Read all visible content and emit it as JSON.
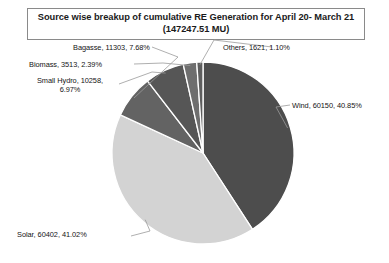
{
  "title": {
    "line1": "Source wise breakup of cumulative RE Generation for April 20- March 21",
    "line2": "(147247.51 MU)"
  },
  "labels": {
    "bagasse": "Bagasse, 11303, 7.68%",
    "others": "Others, 1621, 1.10%",
    "biomass": "Biomass, 3513, 2.39%",
    "small_hydro": "Small Hydro, 10258, 6.97%",
    "wind": "Wind, 60150, 40.85%",
    "solar": "Solar, 60402, 41.02%"
  },
  "chart_data": {
    "type": "pie",
    "title": "Source wise breakup of cumulative RE Generation for April 20- March 21 (147247.51 MU)",
    "unit": "MU",
    "total": 147247.51,
    "legend": "none",
    "labels_position": "outside-with-leader-lines",
    "start_angle_deg": 0,
    "direction": "clockwise",
    "categories": [
      "Wind",
      "Solar",
      "Bagasse",
      "Small Hydro",
      "Biomass",
      "Others"
    ],
    "values": [
      60150,
      60402,
      11303,
      10258,
      3513,
      1621
    ],
    "percents": [
      40.85,
      41.02,
      7.68,
      6.97,
      2.39,
      1.1
    ],
    "colors": [
      "#4d4d4d",
      "#d3d3d3",
      "#636363",
      "#565656",
      "#6e6e6e",
      "#5e5e5e"
    ],
    "slices": [
      {
        "name": "Wind",
        "value": 60150,
        "percent": 40.85,
        "color": "#4d4d4d",
        "label": "Wind, 60150, 40.85%"
      },
      {
        "name": "Solar",
        "value": 60402,
        "percent": 41.02,
        "color": "#d3d3d3",
        "label": "Solar, 60402, 41.02%"
      },
      {
        "name": "Bagasse",
        "value": 11303,
        "percent": 7.68,
        "color": "#636363",
        "label": "Bagasse, 11303, 7.68%"
      },
      {
        "name": "Small Hydro",
        "value": 10258,
        "percent": 6.97,
        "color": "#565656",
        "label": "Small Hydro, 10258, 6.97%"
      },
      {
        "name": "Biomass",
        "value": 3513,
        "percent": 2.39,
        "color": "#6e6e6e",
        "label": "Biomass, 3513, 2.39%"
      },
      {
        "name": "Others",
        "value": 1621,
        "percent": 1.1,
        "color": "#5e5e5e",
        "label": "Others, 1621, 1.10%"
      }
    ]
  },
  "geometry": {
    "center_x": 203,
    "center_y": 153,
    "radius": 91
  },
  "style": {
    "title_border": "#8a8a8a",
    "leader_line": "#9a9a9a",
    "slice_gap": "#ffffff"
  }
}
